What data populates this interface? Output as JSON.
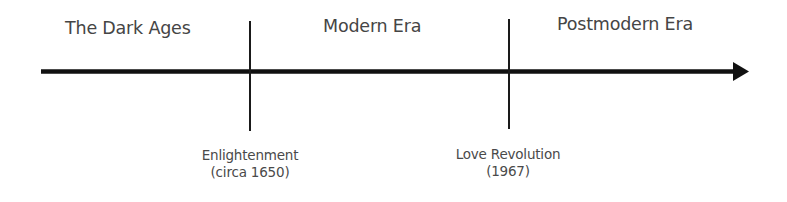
{
  "diagram": {
    "type": "timeline",
    "eras": [
      {
        "label": "The Dark Ages"
      },
      {
        "label": "Modern Era"
      },
      {
        "label": "Postmodern Era"
      }
    ],
    "events": [
      {
        "name": "Enlightenment",
        "date": "(circa 1650)"
      },
      {
        "name": "Love Revolution",
        "date": "(1967)"
      }
    ],
    "colors": {
      "line": "#111111",
      "era_text": "#454545",
      "event_text": "#4a4a4a",
      "background": "#ffffff"
    }
  }
}
